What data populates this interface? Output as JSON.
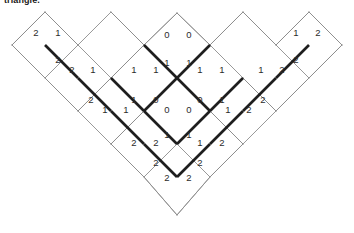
{
  "caption": {
    "text": "triangle."
  },
  "figure": {
    "name": "rhombus-tiling-diagram",
    "type": "lozenge-tiling",
    "colors": {
      "thin_edge": "#8d8d8d",
      "bold_edge": "#1e1e1e",
      "digit": "#2b2b2b",
      "background": "#ffffff"
    },
    "geometry": {
      "unit_x": 33,
      "unit_y": 33,
      "apex": [
        177,
        13
      ],
      "bottom": [
        177,
        215
      ],
      "left_tip": [
        12,
        45
      ],
      "right_tip": [
        342,
        45
      ]
    },
    "outline": [
      [
        12,
        45
      ],
      [
        45,
        12
      ],
      [
        78,
        45
      ],
      [
        111,
        12
      ],
      [
        144,
        45
      ],
      [
        177,
        13
      ],
      [
        210,
        45
      ],
      [
        243,
        12
      ],
      [
        276,
        45
      ],
      [
        309,
        12
      ],
      [
        342,
        45
      ],
      [
        276,
        111
      ],
      [
        243,
        78
      ],
      [
        210,
        111
      ],
      [
        243,
        144
      ],
      [
        210,
        177
      ],
      [
        177,
        215
      ],
      [
        144,
        177
      ],
      [
        111,
        144
      ],
      [
        144,
        111
      ],
      [
        111,
        78
      ],
      [
        78,
        111
      ]
    ],
    "thin_edges": [
      [
        [
          12,
          45
        ],
        [
          45,
          12
        ]
      ],
      [
        [
          45,
          12
        ],
        [
          78,
          45
        ]
      ],
      [
        [
          12,
          45
        ],
        [
          45,
          78
        ]
      ],
      [
        [
          45,
          78
        ],
        [
          78,
          45
        ]
      ],
      [
        [
          45,
          78
        ],
        [
          78,
          111
        ]
      ],
      [
        [
          78,
          111
        ],
        [
          111,
          78
        ]
      ],
      [
        [
          78,
          45
        ],
        [
          111,
          78
        ]
      ],
      [
        [
          78,
          111
        ],
        [
          111,
          144
        ]
      ],
      [
        [
          111,
          144
        ],
        [
          144,
          111
        ]
      ],
      [
        [
          111,
          78
        ],
        [
          144,
          45
        ]
      ],
      [
        [
          144,
          45
        ],
        [
          111,
          12
        ]
      ],
      [
        [
          111,
          12
        ],
        [
          144,
          45
        ]
      ],
      [
        [
          144,
          45
        ],
        [
          177,
          13
        ]
      ],
      [
        [
          177,
          13
        ],
        [
          210,
          45
        ]
      ],
      [
        [
          210,
          45
        ],
        [
          243,
          12
        ]
      ],
      [
        [
          243,
          12
        ],
        [
          276,
          45
        ]
      ],
      [
        [
          276,
          45
        ],
        [
          309,
          12
        ]
      ],
      [
        [
          309,
          12
        ],
        [
          342,
          45
        ]
      ],
      [
        [
          342,
          45
        ],
        [
          309,
          78
        ]
      ],
      [
        [
          309,
          78
        ],
        [
          276,
          45
        ]
      ],
      [
        [
          309,
          78
        ],
        [
          276,
          111
        ]
      ],
      [
        [
          276,
          111
        ],
        [
          243,
          78
        ]
      ],
      [
        [
          276,
          111
        ],
        [
          243,
          144
        ]
      ],
      [
        [
          243,
          144
        ],
        [
          210,
          111
        ]
      ],
      [
        [
          243,
          144
        ],
        [
          210,
          177
        ]
      ],
      [
        [
          210,
          177
        ],
        [
          177,
          215
        ]
      ],
      [
        [
          177,
          215
        ],
        [
          144,
          177
        ]
      ],
      [
        [
          144,
          177
        ],
        [
          111,
          144
        ]
      ],
      [
        [
          144,
          45
        ],
        [
          111,
          78
        ]
      ],
      [
        [
          111,
          78
        ],
        [
          144,
          111
        ]
      ],
      [
        [
          144,
          111
        ],
        [
          177,
          78
        ]
      ],
      [
        [
          177,
          78
        ],
        [
          144,
          45
        ]
      ],
      [
        [
          177,
          78
        ],
        [
          210,
          45
        ]
      ],
      [
        [
          210,
          45
        ],
        [
          243,
          78
        ]
      ],
      [
        [
          243,
          78
        ],
        [
          210,
          111
        ]
      ],
      [
        [
          210,
          111
        ],
        [
          177,
          78
        ]
      ],
      [
        [
          177,
          144
        ],
        [
          144,
          111
        ]
      ],
      [
        [
          177,
          144
        ],
        [
          210,
          111
        ]
      ],
      [
        [
          177,
          144
        ],
        [
          144,
          177
        ]
      ],
      [
        [
          177,
          144
        ],
        [
          210,
          177
        ]
      ],
      [
        [
          144,
          111
        ],
        [
          177,
          144
        ]
      ]
    ],
    "bold_edges": [
      [
        [
          45,
          45
        ],
        [
          78,
          78
        ]
      ],
      [
        [
          78,
          78
        ],
        [
          111,
          111
        ]
      ],
      [
        [
          111,
          111
        ],
        [
          144,
          144
        ]
      ],
      [
        [
          144,
          144
        ],
        [
          177,
          177
        ]
      ],
      [
        [
          177,
          177
        ],
        [
          210,
          144
        ]
      ],
      [
        [
          210,
          144
        ],
        [
          243,
          111
        ]
      ],
      [
        [
          243,
          111
        ],
        [
          276,
          78
        ]
      ],
      [
        [
          276,
          78
        ],
        [
          309,
          45
        ]
      ],
      [
        [
          144,
          45
        ],
        [
          177,
          78
        ]
      ],
      [
        [
          177,
          78
        ],
        [
          210,
          45
        ]
      ],
      [
        [
          111,
          78
        ],
        [
          144,
          111
        ]
      ],
      [
        [
          144,
          111
        ],
        [
          177,
          144
        ]
      ],
      [
        [
          177,
          144
        ],
        [
          210,
          111
        ]
      ],
      [
        [
          210,
          111
        ],
        [
          243,
          78
        ]
      ],
      [
        [
          177,
          78
        ],
        [
          144,
          111
        ]
      ],
      [
        [
          177,
          78
        ],
        [
          210,
          111
        ]
      ]
    ],
    "labels": [
      {
        "id": "L1",
        "value": "2",
        "x": 36,
        "y": 33
      },
      {
        "id": "L2",
        "value": "1",
        "x": 58,
        "y": 33
      },
      {
        "id": "L3",
        "value": "2",
        "x": 58,
        "y": 60
      },
      {
        "id": "L4",
        "value": "2",
        "x": 72,
        "y": 70
      },
      {
        "id": "L5",
        "value": "1",
        "x": 93,
        "y": 70
      },
      {
        "id": "L6",
        "value": "2",
        "x": 91,
        "y": 100
      },
      {
        "id": "L7",
        "value": "1",
        "x": 105,
        "y": 110
      },
      {
        "id": "L8",
        "value": "1",
        "x": 126,
        "y": 110
      },
      {
        "id": "C1",
        "value": "0",
        "x": 167,
        "y": 35
      },
      {
        "id": "C2",
        "value": "0",
        "x": 189,
        "y": 35
      },
      {
        "id": "C3",
        "value": "1",
        "x": 167,
        "y": 63
      },
      {
        "id": "C4",
        "value": "1",
        "x": 189,
        "y": 63
      },
      {
        "id": "C5",
        "value": "1",
        "x": 134,
        "y": 70
      },
      {
        "id": "C6",
        "value": "1",
        "x": 156,
        "y": 70
      },
      {
        "id": "C7",
        "value": "1",
        "x": 200,
        "y": 70
      },
      {
        "id": "C8",
        "value": "1",
        "x": 222,
        "y": 70
      },
      {
        "id": "C9",
        "value": "1",
        "x": 134,
        "y": 100
      },
      {
        "id": "C10",
        "value": "0",
        "x": 156,
        "y": 100
      },
      {
        "id": "C11",
        "value": "0",
        "x": 200,
        "y": 100
      },
      {
        "id": "C12",
        "value": "1",
        "x": 222,
        "y": 100
      },
      {
        "id": "C13",
        "value": "0",
        "x": 167,
        "y": 110
      },
      {
        "id": "C14",
        "value": "0",
        "x": 189,
        "y": 110
      },
      {
        "id": "C15",
        "value": "1",
        "x": 167,
        "y": 135
      },
      {
        "id": "C16",
        "value": "1",
        "x": 189,
        "y": 135
      },
      {
        "id": "C17",
        "value": "2",
        "x": 134,
        "y": 143
      },
      {
        "id": "C18",
        "value": "2",
        "x": 156,
        "y": 143
      },
      {
        "id": "C19",
        "value": "1",
        "x": 200,
        "y": 143
      },
      {
        "id": "C20",
        "value": "2",
        "x": 222,
        "y": 143
      },
      {
        "id": "C21",
        "value": "2",
        "x": 156,
        "y": 163
      },
      {
        "id": "C22",
        "value": "2",
        "x": 200,
        "y": 163
      },
      {
        "id": "C23",
        "value": "2",
        "x": 167,
        "y": 178
      },
      {
        "id": "C24",
        "value": "2",
        "x": 189,
        "y": 178
      },
      {
        "id": "R1",
        "value": "1",
        "x": 296,
        "y": 33
      },
      {
        "id": "R2",
        "value": "2",
        "x": 318,
        "y": 33
      },
      {
        "id": "R3",
        "value": "2",
        "x": 296,
        "y": 60
      },
      {
        "id": "R4",
        "value": "2",
        "x": 282,
        "y": 70
      },
      {
        "id": "R5",
        "value": "1",
        "x": 261,
        "y": 70
      },
      {
        "id": "R6",
        "value": "2",
        "x": 263,
        "y": 100
      },
      {
        "id": "R7",
        "value": "2",
        "x": 249,
        "y": 110
      },
      {
        "id": "R8",
        "value": "1",
        "x": 228,
        "y": 110
      }
    ]
  }
}
